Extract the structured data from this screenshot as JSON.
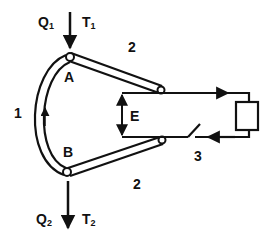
{
  "diagram": {
    "type": "thermocouple-schematic",
    "colors": {
      "stroke": "#111111",
      "background": "#ffffff"
    },
    "flows": {
      "inlet": {
        "heat": "Q",
        "heat_sub": "1",
        "temp": "T",
        "temp_sub": "1"
      },
      "outlet": {
        "heat": "Q",
        "heat_sub": "2",
        "temp": "T",
        "temp_sub": "2"
      }
    },
    "junctions": {
      "top": "A",
      "bottom": "B"
    },
    "labels": {
      "conductor_1": "1",
      "conductor_2_top": "2",
      "conductor_2_bottom": "2",
      "circuit": "3",
      "emf": "E"
    },
    "components": [
      "junction-A",
      "junction-B",
      "conductor-1-arc",
      "conductor-2-upper-rod",
      "conductor-2-lower-rod",
      "emf-arrow",
      "switch",
      "load-box"
    ]
  }
}
